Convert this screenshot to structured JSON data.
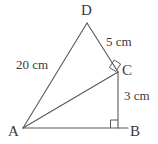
{
  "figure": {
    "background_color": "#ffffff",
    "stroke_color": "#58585a",
    "label_color": "#3a3a3c",
    "vertices": [
      {
        "id": "A",
        "label": "A",
        "x": 23,
        "y": 128
      },
      {
        "id": "B",
        "label": "B",
        "x": 128,
        "y": 128
      },
      {
        "id": "C",
        "label": "C",
        "x": 118,
        "y": 72
      },
      {
        "id": "D",
        "label": "D",
        "x": 87,
        "y": 23
      }
    ],
    "edges": [
      {
        "id": "AD",
        "from": "A",
        "to": "D",
        "length_label": "20 cm"
      },
      {
        "id": "DC",
        "from": "D",
        "to": "C",
        "length_label": "5 cm"
      },
      {
        "id": "CB",
        "from": "C",
        "to": "B",
        "length_label": "3 cm"
      },
      {
        "id": "AB",
        "from": "A",
        "to": "B",
        "length_label": ""
      },
      {
        "id": "AC",
        "from": "A",
        "to": "C",
        "length_label": ""
      }
    ],
    "right_angles": [
      {
        "id": "angle-at-C",
        "at": "C",
        "between": [
          "AC",
          "CD"
        ]
      },
      {
        "id": "angle-at-B",
        "at": "B",
        "between": [
          "AB",
          "BC"
        ]
      }
    ],
    "labels": {
      "vertex_a": "A",
      "vertex_b": "B",
      "vertex_c": "C",
      "vertex_d": "D",
      "side_ad": "20 cm",
      "side_dc": "5 cm",
      "side_cb": "3 cm"
    }
  }
}
